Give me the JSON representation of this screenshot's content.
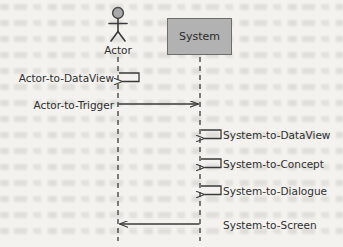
{
  "diagram": {
    "type": "uml-sequence-diagram",
    "background_color": "#f3f2ee",
    "line_color": "#3a3a3a",
    "text_color": "#2e2e2e",
    "participants": [
      {
        "id": "actor",
        "name": "Actor",
        "kind": "actor",
        "lifeline_x": 118,
        "head_fill": "#a9a9a9",
        "head_stroke": "#4a4a4a"
      },
      {
        "id": "system",
        "name": "System",
        "kind": "object",
        "lifeline_x": 200,
        "box_fill": "#b2b2b2",
        "box_stroke": "#6d6d6d"
      }
    ],
    "messages": [
      {
        "label": "Actor-to-DataView",
        "from": "actor",
        "to": "actor",
        "self": true,
        "y": 78,
        "label_side": "left",
        "direction": "self-loop"
      },
      {
        "label": "Actor-to-Trigger",
        "from": "actor",
        "to": "system",
        "self": false,
        "y": 105,
        "label_side": "left",
        "direction": "right"
      },
      {
        "label": "System-to-DataView",
        "from": "system",
        "to": "system",
        "self": true,
        "y": 135,
        "label_side": "right",
        "direction": "self-loop"
      },
      {
        "label": "System-to-Concept",
        "from": "system",
        "to": "system",
        "self": true,
        "y": 164,
        "label_side": "right",
        "direction": "self-loop"
      },
      {
        "label": "System-to-Dialogue",
        "from": "system",
        "to": "system",
        "self": true,
        "y": 191,
        "label_side": "right",
        "direction": "self-loop"
      },
      {
        "label": "System-to-Screen",
        "from": "system",
        "to": "actor",
        "self": false,
        "y": 224,
        "label_side": "right",
        "direction": "left"
      }
    ]
  }
}
